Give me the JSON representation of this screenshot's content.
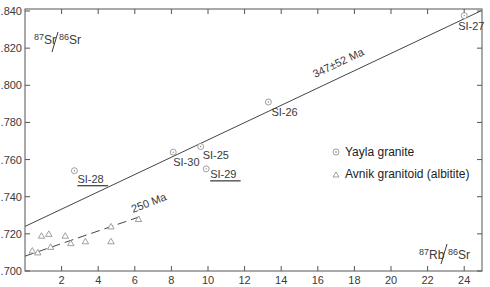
{
  "chart_data": {
    "type": "scatter",
    "title": "",
    "xlabel": "87Rb/86Sr",
    "ylabel": "87Sr/86Sr",
    "xlim": [
      0,
      25
    ],
    "ylim": [
      0.7,
      0.84
    ],
    "x_ticks": [
      2,
      4,
      6,
      8,
      10,
      12,
      14,
      16,
      18,
      20,
      22,
      24
    ],
    "x_tick_labels": [
      "2",
      "4",
      "6",
      "8",
      "10",
      "12",
      "14",
      "16",
      "18",
      "20",
      "22",
      "24"
    ],
    "y_ticks": [
      0.7,
      0.72,
      0.74,
      0.76,
      0.78,
      0.8,
      0.82,
      0.84
    ],
    "y_tick_labels": [
      ".700",
      ".720",
      ".740",
      ".760",
      ".780",
      ".800",
      ".820",
      ".840"
    ],
    "grid": false,
    "legend_position": "center-right",
    "series": [
      {
        "name": "Yayla granite",
        "marker": "circle-dot",
        "points": [
          {
            "label": "SI-27",
            "x": 24.0,
            "y": 0.8375,
            "underlined": false
          },
          {
            "label": "SI-26",
            "x": 13.3,
            "y": 0.791,
            "underlined": false
          },
          {
            "label": "SI-25",
            "x": 9.6,
            "y": 0.767,
            "underlined": false
          },
          {
            "label": "SI-30",
            "x": 8.1,
            "y": 0.764,
            "underlined": false
          },
          {
            "label": "SI-29",
            "x": 9.9,
            "y": 0.755,
            "underlined": true
          },
          {
            "label": "SI-28",
            "x": 2.7,
            "y": 0.754,
            "underlined": true
          }
        ]
      },
      {
        "name": "Avnik granitoid (albitite)",
        "marker": "triangle",
        "points": [
          {
            "x": 0.4,
            "y": 0.711
          },
          {
            "x": 0.7,
            "y": 0.71
          },
          {
            "x": 0.9,
            "y": 0.719
          },
          {
            "x": 1.3,
            "y": 0.72
          },
          {
            "x": 1.4,
            "y": 0.713
          },
          {
            "x": 2.2,
            "y": 0.719
          },
          {
            "x": 2.5,
            "y": 0.715
          },
          {
            "x": 3.3,
            "y": 0.716
          },
          {
            "x": 4.7,
            "y": 0.724
          },
          {
            "x": 4.7,
            "y": 0.716
          },
          {
            "x": 6.2,
            "y": 0.728
          }
        ]
      }
    ],
    "lines": [
      {
        "name": "Yayla isochron",
        "label": "347±52 Ma",
        "style": "solid",
        "from": [
          0,
          0.724
        ],
        "to": [
          24.9,
          0.84
        ]
      },
      {
        "name": "Avnik reference",
        "label": "250 Ma",
        "style": "dashed",
        "from": [
          0,
          0.708
        ],
        "to": [
          6.5,
          0.73
        ]
      }
    ],
    "annotations": [
      "347±52 Ma",
      "250 Ma"
    ]
  },
  "labels": {
    "y_axis": {
      "sup1": "87",
      "base1": "Sr",
      "sup2": "86",
      "base2": "Sr"
    },
    "x_axis": {
      "sup1": "87",
      "base1": "Rb",
      "sup2": "86",
      "base2": "Sr"
    },
    "legend": [
      "Yayla granite",
      "Avnik granitoid (albitite)"
    ],
    "line1": "347±52 Ma",
    "line2": "250 Ma"
  }
}
